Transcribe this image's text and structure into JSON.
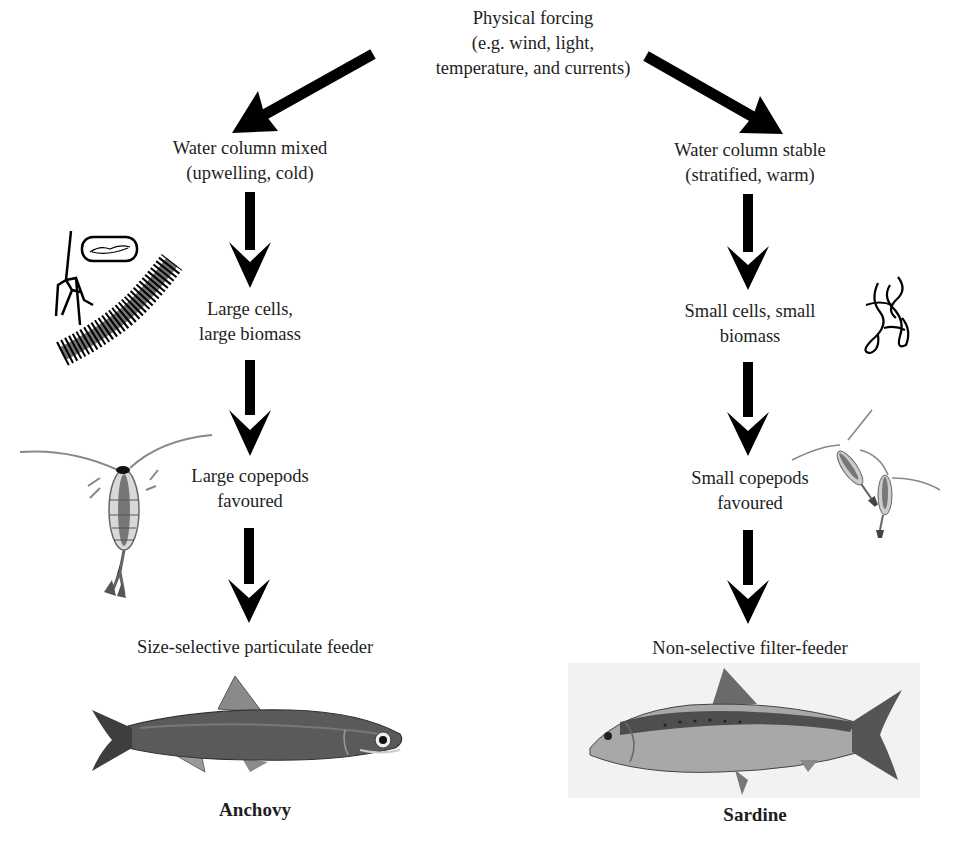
{
  "diagram": {
    "type": "flowchart",
    "root": {
      "lines": [
        "Physical forcing",
        "(e.g. wind, light,",
        "temperature, and currents)"
      ]
    },
    "left_branch": {
      "condition": [
        "Water column mixed",
        "(upwelling, cold)"
      ],
      "phytoplankton": [
        "Large cells,",
        "large biomass"
      ],
      "zooplankton": [
        "Large copepods",
        "favoured"
      ],
      "feeding": "Size-selective particulate feeder",
      "fish": "Anchovy",
      "illustrations": [
        "diatom-chain",
        "dinoflagellate",
        "pennate-diatom",
        "large-copepod",
        "anchovy-fish"
      ]
    },
    "right_branch": {
      "condition": [
        "Water column stable",
        "(stratified, warm)"
      ],
      "phytoplankton": [
        "Small cells, small",
        "biomass"
      ],
      "zooplankton": [
        "Small copepods",
        "favoured"
      ],
      "feeding": "Non-selective filter-feeder",
      "fish": "Sardine",
      "illustrations": [
        "small-phytoplankton-filaments",
        "small-copepods",
        "sardine-fish"
      ]
    },
    "colors": {
      "arrow": "#000000",
      "text": "#1e1e1e",
      "anchovy_body": "#5a5a5a",
      "sardine_body": "#a8a8a8",
      "sardine_bg": "#f2f2f2"
    }
  }
}
